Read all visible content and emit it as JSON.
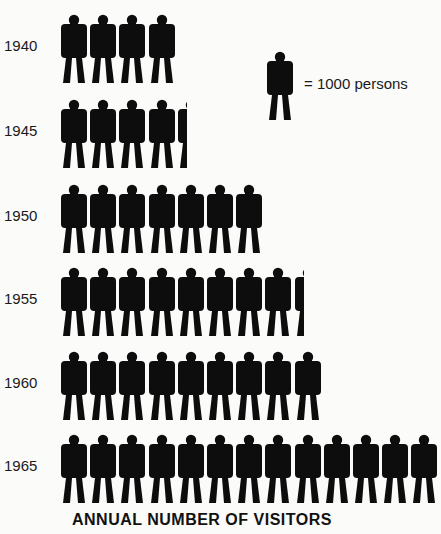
{
  "chart_data": {
    "type": "pictogram",
    "title": "ANNUAL NUMBER OF VISITORS",
    "unit_label": "= 1000 persons",
    "unit_value": 1000,
    "categories": [
      "1940",
      "1945",
      "1950",
      "1955",
      "1960",
      "1965"
    ],
    "icon_counts": [
      4,
      4.5,
      7,
      8.5,
      9,
      13
    ],
    "values": [
      4000,
      4500,
      7000,
      8500,
      9000,
      13000
    ],
    "xlabel": "",
    "ylabel": "",
    "legend_position": "top-right",
    "grid": false
  },
  "colors": {
    "icon": "#0d0d0d",
    "background": "#fbfbfa"
  },
  "legend": {
    "text": "= 1000 persons",
    "icon": "person-icon"
  },
  "title": "ANNUAL NUMBER OF VISITORS"
}
